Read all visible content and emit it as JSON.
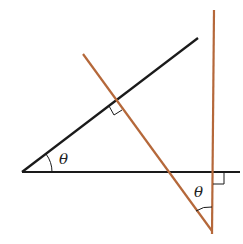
{
  "diagram": {
    "colors": {
      "black_line": "#1a1a1a",
      "orange_line": "#b5683a",
      "background": "#ffffff"
    },
    "labels": {
      "theta_left": "θ",
      "theta_right": "θ"
    },
    "lines": [
      {
        "name": "black-horizontal",
        "x1": 22,
        "y1": 172,
        "x2": 240,
        "y2": 172
      },
      {
        "name": "black-diagonal",
        "x1": 22,
        "y1": 172,
        "x2": 198,
        "y2": 38
      },
      {
        "name": "orange-diagonal",
        "x1": 83,
        "y1": 54,
        "x2": 212,
        "y2": 231
      },
      {
        "name": "orange-vertical",
        "x1": 214,
        "y1": 10,
        "x2": 212,
        "y2": 234
      }
    ],
    "right_angle_markers": 2
  }
}
